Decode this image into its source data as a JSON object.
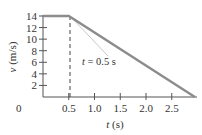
{
  "chart_data": {
    "type": "line",
    "title": "",
    "xlabel": "t (s)",
    "ylabel": "v (m/s)",
    "xlim": [
      0,
      3.0
    ],
    "ylim": [
      0,
      14
    ],
    "grid": false,
    "legend": null,
    "x_ticks": [
      "0.5",
      "1.0",
      "1.5",
      "2.0",
      "2.5"
    ],
    "x_tick_values": [
      0.5,
      1.0,
      1.5,
      2.0,
      2.5
    ],
    "y_ticks": [
      "2",
      "4",
      "6",
      "8",
      "10",
      "12",
      "14"
    ],
    "y_tick_values": [
      2,
      4,
      6,
      8,
      10,
      12,
      14
    ],
    "origin_label": "0",
    "series": [
      {
        "name": "velocity",
        "color": "#8c8c8c",
        "x": [
          0,
          0.5,
          2.95
        ],
        "y": [
          14,
          14,
          0
        ]
      }
    ],
    "reference_lines": [
      {
        "type": "vertical-dashed",
        "x": 0.5,
        "color": "#444444"
      },
      {
        "type": "segment",
        "x": [
          0.5,
          1.25
        ],
        "y": [
          14,
          6.5
        ],
        "color": "#c8c8c8"
      }
    ],
    "annotations": [
      {
        "text": "t = 0.5 s",
        "x": 1.0,
        "y": 5.8
      }
    ]
  }
}
